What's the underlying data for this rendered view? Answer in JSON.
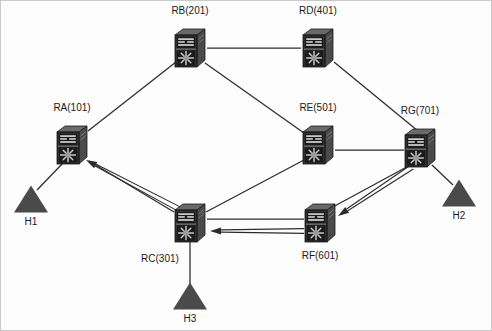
{
  "diagram": {
    "colors": {
      "device": "#3a3a3a",
      "device_dark": "#1f1f1f",
      "device_light": "#6e6e6e",
      "line": "#2b2b2b",
      "host": "#4a4a4a",
      "background": "#fdfdfd",
      "border": "#c9c9c9"
    },
    "routers": [
      {
        "id": "RA",
        "label": "RA(101)",
        "x": 72,
        "y": 145,
        "label_x": 72,
        "label_y": 111,
        "label_anchor": "middle",
        "icon": "router-icon"
      },
      {
        "id": "RB",
        "label": "RB(201)",
        "x": 190,
        "y": 48,
        "label_x": 190,
        "label_y": 14,
        "label_anchor": "middle",
        "icon": "router-icon"
      },
      {
        "id": "RD",
        "label": "RD(401)",
        "x": 318,
        "y": 48,
        "label_x": 318,
        "label_y": 14,
        "label_anchor": "middle",
        "icon": "router-icon"
      },
      {
        "id": "RE",
        "label": "RE(501)",
        "x": 318,
        "y": 145,
        "label_x": 318,
        "label_y": 111,
        "label_anchor": "middle",
        "icon": "router-icon"
      },
      {
        "id": "RG",
        "label": "RG(701)",
        "x": 420,
        "y": 148,
        "label_x": 420,
        "label_y": 114,
        "label_anchor": "middle",
        "icon": "router-icon"
      },
      {
        "id": "RC",
        "label": "RC(301)",
        "x": 190,
        "y": 223,
        "label_x": 160,
        "label_y": 262,
        "label_anchor": "middle",
        "icon": "router-icon"
      },
      {
        "id": "RF",
        "label": "RF(601)",
        "x": 320,
        "y": 223,
        "label_x": 320,
        "label_y": 259,
        "label_anchor": "middle",
        "icon": "router-icon"
      }
    ],
    "hosts": [
      {
        "id": "H1",
        "label": "H1",
        "x": 31,
        "y": 199,
        "label_x": 31,
        "label_y": 225,
        "attached_to": "RA",
        "icon": "host-triangle-icon"
      },
      {
        "id": "H2",
        "label": "H2",
        "x": 459,
        "y": 193,
        "label_x": 459,
        "label_y": 219,
        "attached_to": "RG",
        "icon": "host-triangle-icon"
      },
      {
        "id": "H3",
        "label": "H3",
        "x": 190,
        "y": 296,
        "label_x": 190,
        "label_y": 322,
        "attached_to": "RC",
        "icon": "host-triangle-icon"
      }
    ],
    "links": [
      {
        "from": "RA",
        "to": "RB",
        "x1": 88,
        "y1": 131,
        "x2": 176,
        "y2": 62
      },
      {
        "from": "RB",
        "to": "RD",
        "x1": 207,
        "y1": 48,
        "x2": 301,
        "y2": 48
      },
      {
        "from": "RB",
        "to": "RE",
        "x1": 205,
        "y1": 63,
        "x2": 304,
        "y2": 133
      },
      {
        "from": "RD",
        "to": "RG",
        "x1": 334,
        "y1": 62,
        "x2": 418,
        "y2": 131
      },
      {
        "from": "RE",
        "to": "RG",
        "x1": 335,
        "y1": 150,
        "x2": 404,
        "y2": 150
      },
      {
        "from": "RE",
        "to": "RC",
        "x1": 304,
        "y1": 160,
        "x2": 206,
        "y2": 212
      },
      {
        "from": "RA",
        "to": "RC",
        "x1": 89,
        "y1": 161,
        "x2": 174,
        "y2": 212
      },
      {
        "from": "RC",
        "to": "RF",
        "x1": 207,
        "y1": 219,
        "x2": 304,
        "y2": 219
      },
      {
        "from": "RF",
        "to": "RG",
        "x1": 331,
        "y1": 208,
        "x2": 414,
        "y2": 163
      },
      {
        "from": "RA",
        "to": "H1",
        "x1": 63,
        "y1": 163,
        "x2": 37,
        "y2": 190
      },
      {
        "from": "RG",
        "to": "H2",
        "x1": 432,
        "y1": 165,
        "x2": 453,
        "y2": 185
      },
      {
        "from": "RC",
        "to": "H3",
        "x1": 190,
        "y1": 240,
        "x2": 190,
        "y2": 287
      }
    ],
    "flow_arrows": [
      {
        "id": "flow-rg-rf",
        "from": "RG",
        "to": "RF",
        "label": "RG(701) to RF(601)",
        "x1": 412,
        "y1": 167,
        "x2": 338,
        "y2": 216
      },
      {
        "id": "flow-rf-rc",
        "from": "RF",
        "to": "RC",
        "label": "RF(601) to RC(301)",
        "x1": 304,
        "y1": 231,
        "x2": 210,
        "y2": 231
      },
      {
        "id": "flow-rc-ra",
        "from": "RC",
        "to": "RA",
        "label": "RC(301) to RA(101)",
        "x1": 181,
        "y1": 210,
        "x2": 86,
        "y2": 160
      }
    ]
  }
}
